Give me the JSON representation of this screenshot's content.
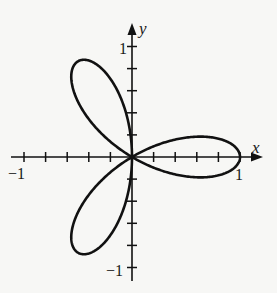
{
  "chart_data": {
    "type": "line",
    "title": "",
    "equation": "r = cos(3θ)",
    "polar": true,
    "theta_range": [
      0,
      3.14159
    ],
    "xlabel": "x",
    "ylabel": "y",
    "xlim": [
      -1,
      1
    ],
    "ylim": [
      -1,
      1
    ],
    "x_tick_step": 0.2,
    "y_tick_step": 0.2,
    "x_tick_labels": [
      {
        "value": -1,
        "text": "−1"
      },
      {
        "value": 1,
        "text": "1"
      }
    ],
    "y_tick_labels": [
      {
        "value": 1,
        "text": "1"
      },
      {
        "value": -1,
        "text": "−1"
      }
    ],
    "grid": false,
    "legend": null,
    "series": [
      {
        "name": "three-petal rose",
        "color": "#111111",
        "petals": 3,
        "petal_tip_angles_deg": [
          0,
          120,
          240
        ]
      }
    ]
  },
  "labels": {
    "x_axis": "x",
    "y_axis": "y",
    "x_neg_one": "−1",
    "x_pos_one": "1",
    "y_pos_one": "1",
    "y_neg_one": "−1"
  },
  "colors": {
    "ink": "#111111",
    "background": "#f7f7f5"
  }
}
